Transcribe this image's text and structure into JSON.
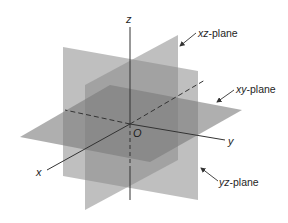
{
  "diagram": {
    "axes": {
      "x": "x",
      "y": "y",
      "z": "z",
      "origin": "O"
    },
    "planes": [
      {
        "id": "xz",
        "label_var": "xz",
        "label_suffix": "-plane"
      },
      {
        "id": "xy",
        "label_var": "xy",
        "label_suffix": "-plane"
      },
      {
        "id": "yz",
        "label_var": "yz",
        "label_suffix": "-plane"
      }
    ],
    "colors": {
      "plane_fill": "#8a8a8a",
      "axis_line": "#333333",
      "label": "#1e1e1e"
    }
  }
}
